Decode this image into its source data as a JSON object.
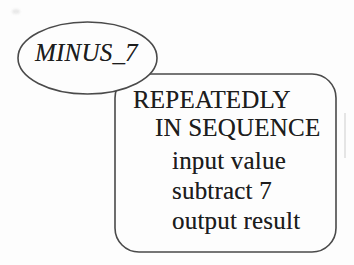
{
  "diagram": {
    "background_color": "#fdfdfd",
    "line_color": "#4a4a4a",
    "text_color": "#1d1d1d",
    "ellipse_node": {
      "label": "MINUS_7"
    },
    "process_box": {
      "lines": [
        {
          "text": "REPEATEDLY"
        },
        {
          "text": "IN SEQUENCE"
        },
        {
          "text": "input value"
        },
        {
          "text": "subtract 7"
        },
        {
          "text": "output result"
        }
      ]
    }
  }
}
